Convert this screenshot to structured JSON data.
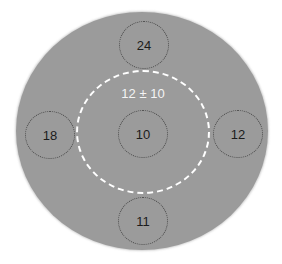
{
  "diagram": {
    "mean_label": "12 ± 10",
    "samples": {
      "top": "24",
      "left": "18",
      "center": "10",
      "right": "12",
      "bottom": "11"
    },
    "colors": {
      "disc_fill": "#9b9b9b",
      "dashed_ring": "#ffffff",
      "sample_border": "#4a4a4a",
      "sample_text": "#1c1c1c",
      "mean_text": "#f4f4f4"
    }
  }
}
